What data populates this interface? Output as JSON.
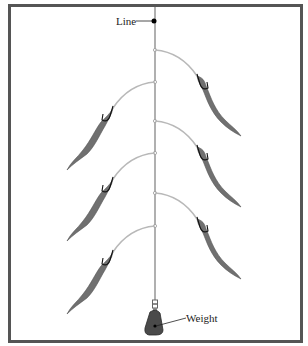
{
  "diagram": {
    "labels": {
      "line": "Line",
      "weight": "Weight"
    },
    "colors": {
      "frame": "#555555",
      "main_line": "#b0b0b0",
      "leader": "#b8b8b8",
      "worm": "#707070",
      "hook": "#111111",
      "weight": "#4a4a4a",
      "label_dot": "#000000"
    },
    "components": {
      "main_line": "vertical line",
      "droppers": [
        {
          "side": "right",
          "order": 1,
          "bait": "worm"
        },
        {
          "side": "left",
          "order": 2,
          "bait": "worm"
        },
        {
          "side": "right",
          "order": 3,
          "bait": "worm"
        },
        {
          "side": "left",
          "order": 4,
          "bait": "worm"
        },
        {
          "side": "right",
          "order": 5,
          "bait": "worm"
        },
        {
          "side": "left",
          "order": 6,
          "bait": "worm"
        }
      ],
      "swivel": "swivel",
      "sinker": "weight"
    }
  }
}
